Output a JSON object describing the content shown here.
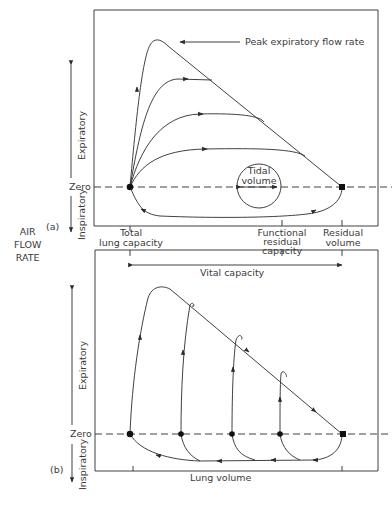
{
  "figure": {
    "y_axis_label": [
      "AIR",
      "FLOW",
      "RATE"
    ],
    "panel_a": {
      "tag": "(a)",
      "zero_label": "Zero",
      "expiratory_label": "Expiratory",
      "inspiratory_label": "Inspiratory",
      "peak_label": "Peak expiratory flow rate",
      "tidal_label_1": "Tidal",
      "tidal_label_2": "volume",
      "x_ticks": {
        "tlc_1": "Total",
        "tlc_2": "lung capacity",
        "frc_1": "Functional",
        "frc_2": "residual",
        "frc_3": "capacity",
        "rv_1": "Residual",
        "rv_2": "volume"
      }
    },
    "panel_b": {
      "tag": "(b)",
      "zero_label": "Zero",
      "expiratory_label": "Expiratory",
      "inspiratory_label": "Inspiratory",
      "vital_capacity_label": "Vital capacity",
      "x_label": "Lung volume"
    },
    "colors": {
      "line": "#2b2b2b",
      "text": "#3a3a3a"
    }
  }
}
